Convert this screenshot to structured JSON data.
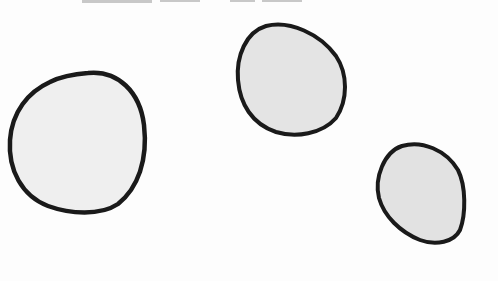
{
  "scene": {
    "description": "Hand-drawn illustration of three rounded pebble-like blobs with thick black outlines on a white background",
    "background_color": "#fdfdfd",
    "outline_color": "#1a1a1a",
    "top_text_cropped": "",
    "shapes": [
      {
        "name": "large-blob-left",
        "fill": "#efefef",
        "cx": 77,
        "cy": 143,
        "rx": 68,
        "ry": 71
      },
      {
        "name": "medium-blob-top",
        "fill": "#e4e4e4",
        "cx": 291,
        "cy": 80,
        "rx": 54,
        "ry": 56
      },
      {
        "name": "small-blob-right",
        "fill": "#e2e2e2",
        "cx": 421,
        "cy": 194,
        "rx": 43,
        "ry": 50
      }
    ]
  }
}
